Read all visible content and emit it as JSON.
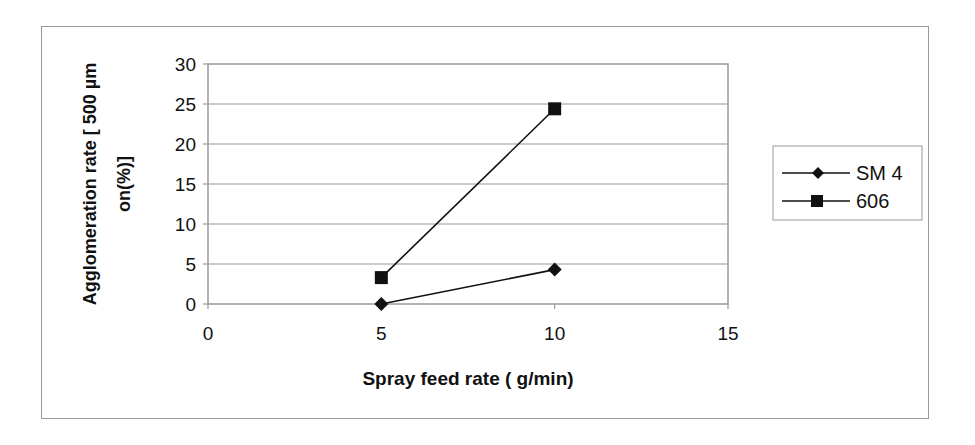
{
  "chart_data": {
    "type": "line",
    "title": "",
    "xlabel": "Spray feed rate ( g/min)",
    "ylabel": "Agglomeration rate [ 500 µm on(%)]",
    "ylabel_line1": "Agglomeration rate [ 500 µm",
    "ylabel_line2": "on(%)]",
    "xlim": [
      0,
      15
    ],
    "ylim": [
      0,
      30
    ],
    "xticks": [
      0,
      5,
      10,
      15
    ],
    "yticks": [
      0,
      5,
      10,
      15,
      20,
      25,
      30
    ],
    "grid": "horizontal",
    "legend_position": "right",
    "series": [
      {
        "name": "SM 4",
        "marker": "diamond",
        "x": [
          5,
          10
        ],
        "values": [
          0,
          4.3
        ]
      },
      {
        "name": "606",
        "marker": "square",
        "x": [
          5,
          10
        ],
        "values": [
          3.3,
          24.4
        ]
      }
    ]
  },
  "colors": {
    "line": "#111111",
    "grid": "#9a9a9a",
    "frame": "#9a9a9a"
  }
}
